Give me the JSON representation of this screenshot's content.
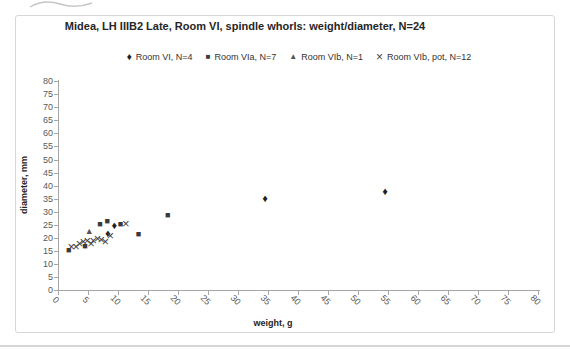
{
  "chart": {
    "frame_border_color": "#d6d6d6",
    "axis_color": "#a6a6a6",
    "tick_text_color": "#595959",
    "title_color": "#262626"
  },
  "chart_data": {
    "type": "scatter",
    "title": "Midea, LH IIIB2 Late, Room VI, spindle whorls: weight/diameter, N=24",
    "xlabel": "weight, g",
    "ylabel": "diameter, mm",
    "xlim": [
      0,
      80
    ],
    "ylim": [
      0,
      80
    ],
    "xticks": [
      0,
      5,
      10,
      15,
      20,
      25,
      30,
      35,
      40,
      45,
      50,
      55,
      60,
      65,
      70,
      75,
      80
    ],
    "yticks": [
      0,
      5,
      10,
      15,
      20,
      25,
      30,
      35,
      40,
      45,
      50,
      55,
      60,
      65,
      70,
      75,
      80
    ],
    "grid": false,
    "legend_position": "top",
    "series": [
      {
        "name": "Room VI, N=4",
        "marker": "diamond",
        "color": "#1f1f1f",
        "points": [
          [
            8.3,
            21.3
          ],
          [
            9.4,
            24.6
          ],
          [
            34.5,
            35
          ],
          [
            54.5,
            37.5
          ]
        ]
      },
      {
        "name": "Room VIa, N=7",
        "marker": "square",
        "color": "#3a3a3a",
        "points": [
          [
            1.8,
            14.8
          ],
          [
            4.5,
            16.3
          ],
          [
            7,
            25
          ],
          [
            8.2,
            26
          ],
          [
            10.4,
            25
          ],
          [
            13.4,
            21
          ],
          [
            18.3,
            28.5
          ]
        ]
      },
      {
        "name": "Room VIb, N=1",
        "marker": "triangle",
        "color": "#555555",
        "points": [
          [
            5.2,
            22.4
          ]
        ]
      },
      {
        "name": "Room VIb, pot, N=12",
        "marker": "x",
        "color": "#3f3f3f",
        "points": [
          [
            2.2,
            16.3
          ],
          [
            3,
            16.6
          ],
          [
            3.6,
            17.5
          ],
          [
            4.2,
            18.2
          ],
          [
            4.9,
            18.6
          ],
          [
            5.5,
            17.8
          ],
          [
            5.9,
            18.6
          ],
          [
            6.6,
            19.5
          ],
          [
            7.2,
            19.3
          ],
          [
            7.9,
            18.4
          ],
          [
            8.7,
            20.6
          ],
          [
            11.3,
            25.3
          ]
        ]
      }
    ]
  }
}
